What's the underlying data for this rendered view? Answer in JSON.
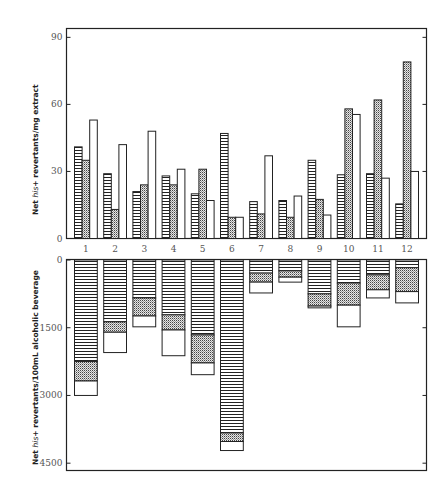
{
  "chart_data": [
    {
      "id": "top",
      "type": "bar",
      "title": "",
      "xlabel": "",
      "ylabel": "Net his+ revertants/mg extract",
      "ylabel_parts": [
        "Net ",
        "his",
        "+ revertants/mg extract"
      ],
      "categories": [
        "1",
        "2",
        "3",
        "4",
        "5",
        "6",
        "7",
        "8",
        "9",
        "10",
        "11",
        "12"
      ],
      "yticks": [
        0,
        30,
        60,
        90
      ],
      "ylim": [
        0,
        95
      ],
      "grid": false,
      "legend": "none",
      "series": [
        {
          "name": "striped",
          "pattern": "horizontal-stripes",
          "values": [
            41,
            29,
            21,
            28,
            20,
            47,
            16.5,
            17,
            35,
            28.5,
            29,
            15.5
          ]
        },
        {
          "name": "dotted",
          "pattern": "stipple",
          "values": [
            35,
            13,
            24,
            24,
            31,
            9.5,
            11,
            9.5,
            17.5,
            58,
            62,
            79
          ]
        },
        {
          "name": "open",
          "pattern": "none",
          "values": [
            53,
            42,
            48,
            31,
            17,
            9.5,
            37,
            19,
            10.5,
            55.5,
            27,
            30
          ]
        }
      ]
    },
    {
      "id": "bottom",
      "type": "bar",
      "stacked": true,
      "inverted_axis": true,
      "title": "",
      "xlabel": "",
      "ylabel": "Net his+ revertants/100mL alcoholic beverage",
      "ylabel_parts": [
        "Net ",
        "his",
        "+ revertants/100mL alcoholic beverage"
      ],
      "categories": [
        "1",
        "2",
        "3",
        "4",
        "5",
        "6",
        "7",
        "8",
        "9",
        "10",
        "11",
        "12"
      ],
      "yticks": [
        0,
        1500,
        3000,
        4500
      ],
      "ylim": [
        0,
        4700
      ],
      "grid": false,
      "legend": "none",
      "series": [
        {
          "name": "striped",
          "pattern": "horizontal-stripes",
          "values": [
            2250,
            1370,
            840,
            1215,
            1660,
            3830,
            290,
            240,
            750,
            510,
            330,
            170
          ]
        },
        {
          "name": "dotted",
          "pattern": "stipple",
          "values": [
            430,
            230,
            400,
            335,
            620,
            190,
            200,
            140,
            270,
            490,
            330,
            530
          ]
        },
        {
          "name": "open",
          "pattern": "none",
          "values": [
            320,
            450,
            240,
            570,
            260,
            200,
            240,
            110,
            40,
            480,
            180,
            250
          ]
        }
      ],
      "cumulative_totals": [
        3000,
        2050,
        1480,
        2120,
        2540,
        4220,
        730,
        490,
        1060,
        1480,
        840,
        950
      ]
    }
  ]
}
